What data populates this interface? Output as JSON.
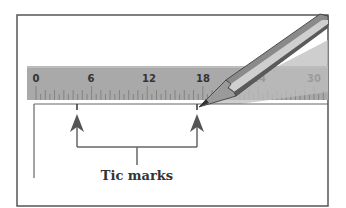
{
  "figure": {
    "caption": "Tic marks",
    "ruler": {
      "labels": [
        "0",
        "6",
        "12",
        "18",
        "24",
        "30"
      ],
      "units_range": [
        0,
        30
      ],
      "color": "#a9a9a9"
    },
    "annotations": [
      {
        "name": "tic-mark-left",
        "ruler_value": 4.5
      },
      {
        "name": "tic-mark-right",
        "ruler_value": 17.5
      }
    ],
    "colors": {
      "frame": "#555555",
      "line": "#666666",
      "arrow": "#555555",
      "pencil_body": "#8a8a8a",
      "pencil_highlight": "#cfcfcf",
      "pencil_shadow": "#5a5a5a",
      "pencil_tip": "#777777",
      "shadow": "#bdbdbd"
    }
  }
}
